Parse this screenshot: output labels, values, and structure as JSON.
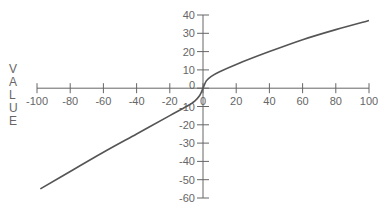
{
  "chart_data": {
    "type": "line",
    "title": "",
    "xlabel": "",
    "ylabel": "VALUE",
    "xlim": [
      -100,
      100
    ],
    "ylim": [
      -60,
      40
    ],
    "x_ticks": [
      -100,
      -80,
      -60,
      -40,
      -20,
      0,
      20,
      40,
      60,
      80,
      100
    ],
    "y_ticks": [
      40,
      30,
      20,
      10,
      0,
      -10,
      -20,
      -30,
      -40,
      -50,
      -60
    ],
    "grid": false,
    "legend": null,
    "series": [
      {
        "name": "curve",
        "color": "#555555",
        "x": [
          -98,
          -80,
          -60,
          -40,
          -20,
          -10,
          -5,
          -2,
          0,
          2,
          5,
          10,
          20,
          40,
          60,
          80,
          100
        ],
        "y": [
          -55,
          -45.5,
          -35,
          -25,
          -15,
          -10,
          -7,
          -4,
          0,
          4,
          6.5,
          9,
          13,
          20,
          26.5,
          32,
          37
        ]
      }
    ]
  },
  "axis": {
    "ylabel_letters": [
      "V",
      "A",
      "L",
      "U",
      "E"
    ]
  },
  "colors": {
    "axis": "#666666",
    "line": "#555555",
    "background": "#ffffff"
  }
}
